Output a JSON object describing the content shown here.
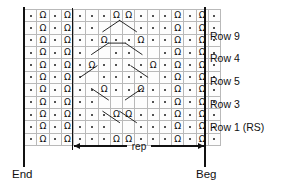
{
  "chart_data": {
    "type": "table",
    "grid": {
      "columns": 16,
      "rows": 11,
      "repeat_start_column": 6,
      "repeat_end_column": 16
    },
    "symbols": {
      "purl": "·",
      "knit_twisted": "Ω",
      "blank": ""
    },
    "cells": [
      [
        "purl",
        "knit",
        "purl",
        "knit",
        "purl",
        "purl",
        "purl",
        "knit",
        "knit",
        "purl",
        "purl",
        "purl",
        "knit",
        "purl",
        "knit",
        "purl"
      ],
      [
        "purl",
        "knit",
        "purl",
        "knit",
        "purl",
        "purl",
        "blank",
        "blank",
        "blank",
        "purl",
        "purl",
        "purl",
        "knit",
        "purl",
        "knit",
        "purl"
      ],
      [
        "purl",
        "knit",
        "purl",
        "knit",
        "purl",
        "purl",
        "knit",
        "purl",
        "purl",
        "knit",
        "purl",
        "purl",
        "knit",
        "purl",
        "knit",
        "purl"
      ],
      [
        "purl",
        "knit",
        "purl",
        "knit",
        "purl",
        "blank",
        "blank",
        "purl",
        "purl",
        "blank",
        "blank",
        "purl",
        "knit",
        "purl",
        "knit",
        "purl"
      ],
      [
        "purl",
        "knit",
        "purl",
        "knit",
        "purl",
        "knit",
        "purl",
        "purl",
        "purl",
        "purl",
        "knit",
        "purl",
        "knit",
        "purl",
        "knit",
        "purl"
      ],
      [
        "purl",
        "knit",
        "purl",
        "knit",
        "purl",
        "blank",
        "purl",
        "purl",
        "purl",
        "purl",
        "blank",
        "purl",
        "knit",
        "purl",
        "knit",
        "purl"
      ],
      [
        "purl",
        "knit",
        "purl",
        "knit",
        "purl",
        "purl",
        "knit",
        "purl",
        "purl",
        "knit",
        "purl",
        "purl",
        "knit",
        "purl",
        "knit",
        "purl"
      ],
      [
        "purl",
        "knit",
        "purl",
        "knit",
        "purl",
        "purl",
        "blank",
        "blank",
        "blank",
        "blank",
        "purl",
        "purl",
        "knit",
        "purl",
        "knit",
        "purl"
      ],
      [
        "purl",
        "knit",
        "purl",
        "knit",
        "purl",
        "purl",
        "purl",
        "knit",
        "knit",
        "purl",
        "purl",
        "purl",
        "knit",
        "purl",
        "knit",
        "purl"
      ],
      [
        "purl",
        "knit",
        "purl",
        "knit",
        "purl",
        "purl",
        "purl",
        "blank",
        "blank",
        "purl",
        "purl",
        "purl",
        "knit",
        "purl",
        "knit",
        "purl"
      ],
      [
        "purl",
        "knit",
        "purl",
        "knit",
        "purl",
        "purl",
        "purl",
        "knit",
        "knit",
        "purl",
        "purl",
        "purl",
        "knit",
        "purl",
        "knit",
        "purl"
      ]
    ]
  },
  "row_labels": [
    {
      "text": "Row 9",
      "grid_row": 2
    },
    {
      "text": "Row 4",
      "grid_row": 4
    },
    {
      "text": "Row 5",
      "grid_row": 6
    },
    {
      "text": "Row 3",
      "grid_row": 8
    },
    {
      "text": "Row 1 (RS)",
      "grid_row": 10
    }
  ],
  "repeat": {
    "label": "rep"
  },
  "captions": {
    "end": "End",
    "beg": "Beg"
  },
  "colors": {
    "ink": "#111111",
    "grid_line": "#b9b9b9",
    "cell_fill": "#fdfdfd",
    "page": "#ffffff"
  }
}
